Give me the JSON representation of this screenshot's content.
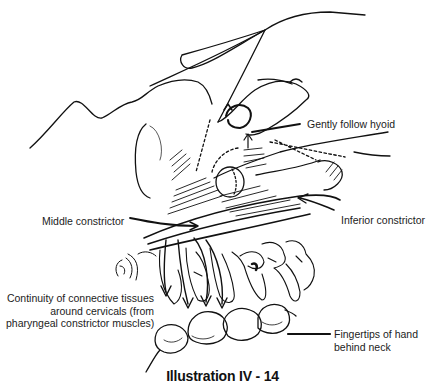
{
  "figure": {
    "caption": "Illustration IV - 14",
    "labels": {
      "hyoid": "Gently follow hyoid",
      "middle_constrictor": "Middle constrictor",
      "inferior_constrictor": "Inferior constrictor",
      "connective_line1": "Continuity of connective tissues",
      "connective_line2": "around cervicals (from",
      "connective_line3": "pharyngeal constrictor muscles)",
      "fingertips_line1": "Fingertips of hand",
      "fingertips_line2": "behind neck"
    },
    "line_color": "#111111",
    "background": "#ffffff"
  }
}
